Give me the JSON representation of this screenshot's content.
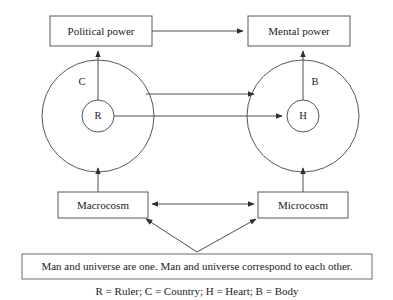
{
  "figure": {
    "type": "conceptual-diagram",
    "title_text": "",
    "boxes": {
      "political_power": "Political power",
      "mental_power": "Mental power",
      "macrocosm": "Macrocosm",
      "microcosm": "Microcosm"
    },
    "nodes": {
      "ruler": "R",
      "country": "C",
      "heart": "H",
      "body": "B"
    },
    "caption": "Man and universe are one. Man and universe correspond to each other.",
    "legend": "R = Ruler; C = Country; H = Heart; B = Body",
    "colors": {
      "stroke": "#55595c",
      "text": "#1b1b1b",
      "background": "#ffffff",
      "arrow": "#2d3032"
    }
  }
}
